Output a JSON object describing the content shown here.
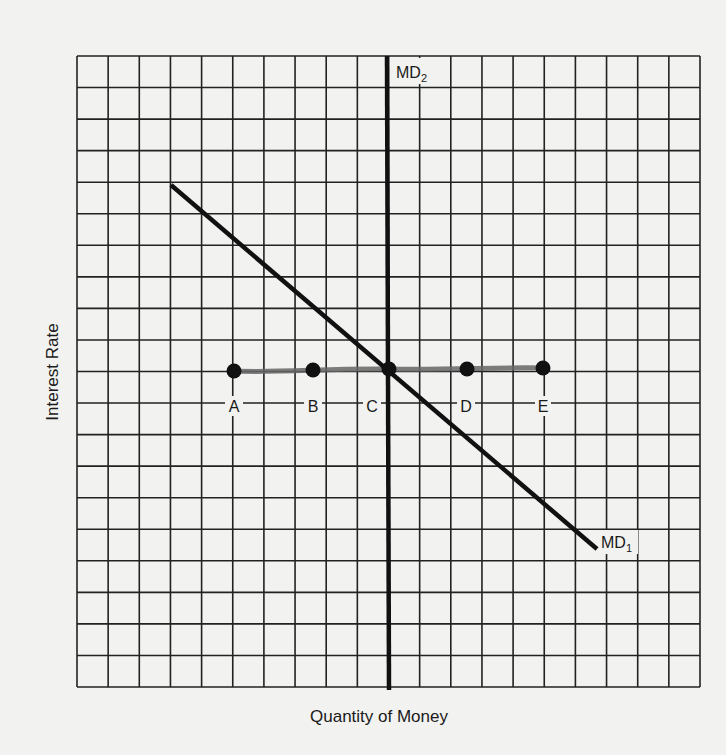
{
  "chart_data": {
    "type": "line",
    "title": "",
    "xlabel": "Quantity of Money",
    "ylabel": "Interest Rate",
    "grid": true,
    "grid_columns": 20,
    "grid_rows": 20,
    "series": [
      {
        "name": "MD1",
        "label_main": "MD",
        "label_sub": "1",
        "style": "thick-solid",
        "points": [
          [
            3,
            16
          ],
          [
            16.7,
            4.6
          ]
        ]
      },
      {
        "name": "MD2",
        "label_main": "MD",
        "label_sub": "2",
        "style": "thick-solid-vertical",
        "points": [
          [
            10,
            0
          ],
          [
            10,
            20
          ]
        ]
      },
      {
        "name": "Interest rate level",
        "style": "hand-drawn-horizontal",
        "points": [
          [
            5,
            10.5
          ],
          [
            15,
            10.5
          ]
        ]
      }
    ],
    "points": [
      {
        "label": "A",
        "x": 5,
        "y": 10.5
      },
      {
        "label": "B",
        "x": 7.5,
        "y": 10.5
      },
      {
        "label": "C",
        "x": 10,
        "y": 10.5
      },
      {
        "label": "D",
        "x": 12.5,
        "y": 10.5
      },
      {
        "label": "E",
        "x": 15,
        "y": 10.5
      }
    ],
    "xlim": [
      0,
      20
    ],
    "ylim": [
      0,
      20
    ],
    "legend": "none (inline line labels)"
  },
  "labels": {
    "x_axis": "Quantity of Money",
    "y_axis": "Interest Rate",
    "md1_main": "MD",
    "md1_sub": "1",
    "md2_main": "MD",
    "md2_sub": "2",
    "point_a": "A",
    "point_b": "B",
    "point_c": "C",
    "point_d": "D",
    "point_e": "E"
  },
  "colors": {
    "background": "#f2f2f0",
    "grid": "#222222",
    "lines": "#111111",
    "highlight": "#555555"
  }
}
